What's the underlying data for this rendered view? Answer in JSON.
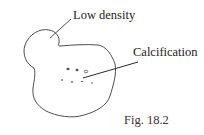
{
  "figure": {
    "caption": "Fig. 18.2",
    "labels": {
      "low_density": "Low density",
      "calcification": "Calcification"
    },
    "colors": {
      "stroke": "#3a3a3a",
      "text": "#222222",
      "background": "#ffffff"
    }
  }
}
